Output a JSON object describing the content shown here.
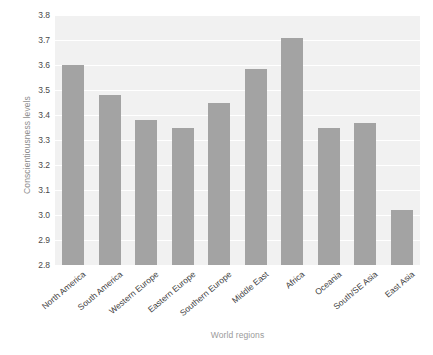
{
  "chart_data": {
    "type": "bar",
    "title": "",
    "xlabel": "World regions",
    "ylabel": "Conscientiousness levels",
    "categories": [
      "North America",
      "South America",
      "Western Europe",
      "Eastern Europe",
      "Southern Europe",
      "Middle East",
      "Africa",
      "Oceania",
      "South/SE Asia",
      "East Asia"
    ],
    "values": [
      3.6,
      3.48,
      3.38,
      3.35,
      3.45,
      3.585,
      3.71,
      3.35,
      3.37,
      3.02
    ],
    "ylim": [
      2.8,
      3.8
    ],
    "yticks": [
      "2.8",
      "2.9",
      "3.0",
      "3.1",
      "3.2",
      "3.3",
      "3.4",
      "3.5",
      "3.6",
      "3.7",
      "3.8"
    ],
    "ytick_values": [
      2.8,
      2.9,
      3.0,
      3.1,
      3.2,
      3.3,
      3.4,
      3.5,
      3.6,
      3.7,
      3.8
    ],
    "grid": true,
    "legend": "none",
    "bar_color": "#a3a3a3",
    "plot_background": "#f1f1f1",
    "gridline_color": "#ffffff",
    "axis_label_color": "#9a9a9a",
    "tick_label_color": "#3d3d3d"
  }
}
